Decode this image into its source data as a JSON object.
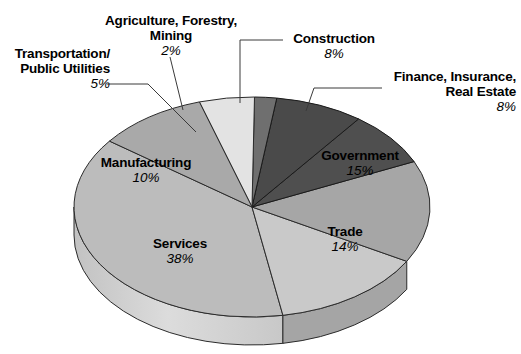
{
  "chart_data": {
    "type": "pie",
    "title": "",
    "subtitle": "",
    "xlabel": "",
    "ylabel": "",
    "legend_position": "none",
    "grid": false,
    "units": "percent",
    "total": 100,
    "categories": [
      "Construction",
      "Finance, Insurance, Real Estate",
      "Government",
      "Trade",
      "Services",
      "Manufacturing",
      "Transportation/Public Utilities",
      "Agriculture, Forestry, Mining"
    ],
    "values": [
      8,
      8,
      15,
      14,
      38,
      10,
      5,
      2
    ],
    "labels_formatted": [
      "8%",
      "8%",
      "15%",
      "14%",
      "38%",
      "10%",
      "5%",
      "2%"
    ],
    "colors": [
      "#4a4a4a",
      "#4f4f4f",
      "#a6a6a6",
      "#c9c9c9",
      "#bcbcbc",
      "#a9a9a9",
      "#e3e3e3",
      "#6f6f6f"
    ]
  },
  "slices": [
    {
      "id": "construction",
      "name": "Construction",
      "pct": "8%",
      "value": 8,
      "top_color": "#4a4a4a",
      "side_color": "#3b3b3b",
      "label_placement": "external"
    },
    {
      "id": "finance-insurance-real-estate",
      "name_line1": "Finance, Insurance,",
      "name_line2": "Real Estate",
      "name": "Finance, Insurance, Real Estate",
      "pct": "8%",
      "value": 8,
      "top_color": "#4f4f4f",
      "side_color": "#3f3f3f",
      "label_placement": "external"
    },
    {
      "id": "government",
      "name": "Government",
      "pct": "15%",
      "value": 15,
      "top_color": "#a6a6a6",
      "side_color": "#8c8c8c",
      "label_placement": "internal"
    },
    {
      "id": "trade",
      "name": "Trade",
      "pct": "14%",
      "value": 14,
      "top_color": "#c9c9c9",
      "side_color": "#a5a5a5",
      "label_placement": "internal"
    },
    {
      "id": "services",
      "name": "Services",
      "pct": "38%",
      "value": 38,
      "top_color": "#bcbcbc",
      "side_color": "#cfcfcf",
      "label_placement": "internal"
    },
    {
      "id": "manufacturing",
      "name": "Manufacturing",
      "pct": "10%",
      "value": 10,
      "top_color": "#a9a9a9",
      "side_color": "#9a9a9a",
      "label_placement": "internal"
    },
    {
      "id": "transportation-public-utilities",
      "name_line1": "Transportation/",
      "name_line2": "Public Utilities",
      "name": "Transportation/Public Utilities",
      "pct": "5%",
      "value": 5,
      "top_color": "#e3e3e3",
      "side_color": "#c4c4c4",
      "label_placement": "external"
    },
    {
      "id": "agriculture-forestry-mining",
      "name_line1": "Agriculture, Forestry,",
      "name_line2": "Mining",
      "name": "Agriculture, Forestry, Mining",
      "pct": "2%",
      "value": 2,
      "top_color": "#6f6f6f",
      "side_color": "#5c5c5c",
      "label_placement": "external"
    }
  ]
}
